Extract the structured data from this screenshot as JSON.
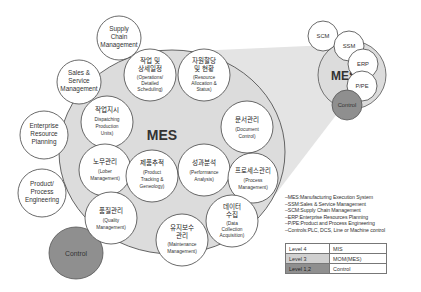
{
  "diagram": {
    "main_circle": {
      "label": "MES",
      "fill": "#dedede",
      "stroke": "#555555"
    },
    "outer_circles": [
      {
        "id": "supply-chain",
        "lines": [
          "Supply",
          "Chain",
          "Management"
        ]
      },
      {
        "id": "sales-service",
        "lines": [
          "Sales &",
          "Service",
          "Management"
        ]
      },
      {
        "id": "erp",
        "lines": [
          "Enterprise",
          "Resource",
          "Planning"
        ]
      },
      {
        "id": "product-process",
        "lines": [
          "Product/",
          "Process",
          "Engineering"
        ]
      },
      {
        "id": "control",
        "lines": [
          "Control"
        ],
        "fill": "#8f8f8f"
      }
    ],
    "inner_circles": [
      {
        "id": "operations-scheduling",
        "kr": [
          "작업 및",
          "상세일정"
        ],
        "en": [
          "(Operations/",
          "Detailed",
          "Scheduling)"
        ]
      },
      {
        "id": "resource-allocation",
        "kr": [
          "자원할당",
          "및 현황"
        ],
        "en": [
          "(Resource",
          "Allocation &",
          "Status)"
        ]
      },
      {
        "id": "dispatching",
        "kr": [
          "작업지시"
        ],
        "en": [
          "Dispatching",
          "Production",
          "Units)"
        ]
      },
      {
        "id": "document-control",
        "kr": [
          "문서관리"
        ],
        "en": [
          "(Document",
          "Control)"
        ]
      },
      {
        "id": "labor-management",
        "kr": [
          "노무관리"
        ],
        "en": [
          "(Lober",
          "Management)"
        ]
      },
      {
        "id": "product-tracking",
        "kr": [
          "제품추적"
        ],
        "en": [
          "(Product",
          "Tracking &",
          "Geneology)"
        ]
      },
      {
        "id": "performance-analysis",
        "kr": [
          "성과분석"
        ],
        "en": [
          "(Performance",
          "Analysis)"
        ]
      },
      {
        "id": "process-management",
        "kr": [
          "프로세스관리"
        ],
        "en": [
          "(Process",
          "Management)"
        ]
      },
      {
        "id": "quality-management",
        "kr": [
          "품질관리"
        ],
        "en": [
          "(Quality",
          "Management)"
        ]
      },
      {
        "id": "data-collection",
        "kr": [
          "데이터",
          "수집"
        ],
        "en": [
          "(Data",
          "Collection",
          "Acquisition)"
        ]
      },
      {
        "id": "maintenance-management",
        "kr": [
          "유지보수",
          "관리"
        ],
        "en": [
          "(Maintenance",
          "Management)"
        ]
      }
    ],
    "mini_diagram": {
      "center": "MES",
      "satellites": [
        "SCM",
        "SSM",
        "ERP",
        "P/PE",
        "Control"
      ]
    }
  },
  "legend": [
    "–MES:Manufacturing Execution System",
    "–SSM:Sales & Service Management",
    "–SCM:Supply Chain Management",
    "–ERP:Enterprise Resources Planning",
    "–P/PE:Product and Process Engineering",
    "–Controls:PLC, DCS, Line or Machine control"
  ],
  "levels_table": [
    {
      "level": "Level 4",
      "system": "MIS",
      "shade": "#ffffff"
    },
    {
      "level": "Level 3",
      "system": "MOM(MES)",
      "shade": "#d0d0d0"
    },
    {
      "level": "Level 1,2",
      "system": "Control",
      "shade": "#8f8f8f"
    }
  ]
}
